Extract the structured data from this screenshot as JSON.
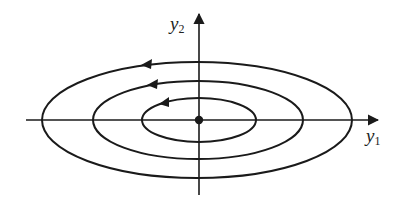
{
  "diagram": {
    "type": "phase-portrait",
    "axes": {
      "x_label": {
        "base": "y",
        "sub": "1"
      },
      "y_label": {
        "base": "y",
        "sub": "2"
      }
    },
    "center_point": {
      "cx": 199,
      "cy": 120
    },
    "orbits": [
      {
        "name": "outer",
        "rx": 155,
        "ry": 58,
        "direction": "counterclockwise"
      },
      {
        "name": "middle",
        "rx": 105,
        "ry": 39,
        "direction": "counterclockwise"
      },
      {
        "name": "inner",
        "rx": 57,
        "ry": 22,
        "direction": "counterclockwise"
      }
    ],
    "colors": {
      "stroke": "#1a1a1a",
      "background": "#ffffff"
    }
  }
}
